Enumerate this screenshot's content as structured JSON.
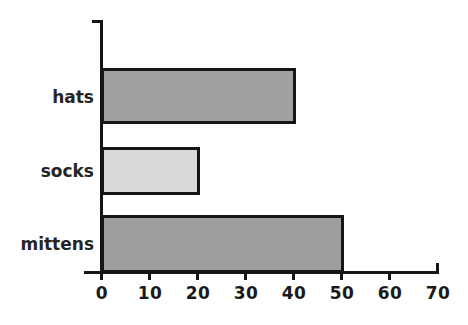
{
  "chart_data": {
    "type": "bar",
    "orientation": "horizontal",
    "title": "",
    "subtitle": "",
    "xlabel": "",
    "ylabel": "",
    "categories": [
      "hats",
      "socks",
      "mittens"
    ],
    "values": [
      40,
      20,
      50
    ],
    "series": [
      {
        "name": "",
        "values": [
          40,
          20,
          50
        ]
      }
    ],
    "bar_colors": [
      "#a0a0a0",
      "#d9d9d9",
      "#9d9d9d"
    ],
    "bar_edge_color": "#151515",
    "xlim": [
      0,
      70
    ],
    "ylim": [
      0,
      3
    ],
    "xticks": [
      0,
      10,
      20,
      30,
      40,
      50,
      60,
      70
    ],
    "xtick_labels": [
      "0",
      "10",
      "20",
      "30",
      "40",
      "50",
      "60",
      "70"
    ],
    "grid": false,
    "legend": false,
    "legend_position": "none",
    "background_color": "#ffffff",
    "bars": [
      {
        "label": "hats",
        "value": 40,
        "fill": "#a0a0a0"
      },
      {
        "label": "socks",
        "value": 20,
        "fill": "#d9d9d9"
      },
      {
        "label": "mittens",
        "value": 50,
        "fill": "#9d9d9d"
      }
    ]
  }
}
